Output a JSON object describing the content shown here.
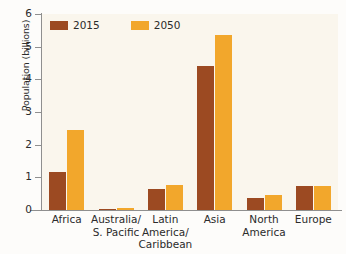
{
  "chart_data": {
    "type": "bar",
    "title": "",
    "xlabel": "",
    "ylabel": "Population (billions)",
    "ylim": [
      0,
      6
    ],
    "yticks": [
      "0",
      "1",
      "2",
      "3",
      "4",
      "5",
      "6"
    ],
    "grid": false,
    "legend_position": "upper left",
    "categories": [
      "Africa",
      "Australia/\nS. Pacific",
      "Latin America/\nCaribbean",
      "Asia",
      "North\nAmerica",
      "Europe"
    ],
    "series": [
      {
        "name": "2015",
        "color": "#9c4a22",
        "values": [
          1.15,
          0.04,
          0.63,
          4.4,
          0.36,
          0.74
        ]
      },
      {
        "name": "2050",
        "color": "#f2a72c",
        "values": [
          2.45,
          0.06,
          0.78,
          5.35,
          0.46,
          0.73
        ]
      }
    ]
  },
  "colors": {
    "series_2015": "#9c4a22",
    "series_2050": "#f2a72c",
    "plot_background": "#faf6ed",
    "axis_line": "#8f8f8f",
    "text": "#2b2b2b"
  }
}
